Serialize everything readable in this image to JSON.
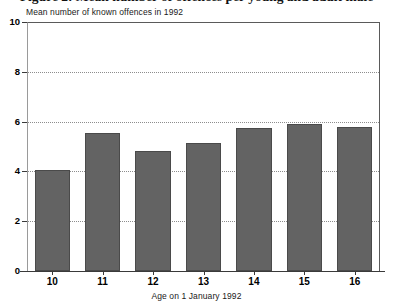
{
  "figure": {
    "title_partial": "Figure 2: Mean number of offences per young and adult male"
  },
  "chart_data": {
    "type": "bar",
    "title": "",
    "subtitle": "Mean number of known offences in 1992",
    "xlabel": "Age on 1 January 1992",
    "ylabel": "Mean number of known offences in 1992",
    "categories": [
      "10",
      "11",
      "12",
      "13",
      "14",
      "15",
      "16"
    ],
    "values": [
      4.05,
      5.55,
      4.8,
      5.15,
      5.75,
      5.9,
      5.8
    ],
    "ylim": [
      0,
      10
    ],
    "ytick_labels": [
      "0",
      "2",
      "4",
      "6",
      "8",
      "10"
    ],
    "ytick_values": [
      0,
      2,
      4,
      6,
      8,
      10
    ],
    "gridlines_at": [
      2,
      4,
      6,
      8
    ],
    "grid": true,
    "legend": "none",
    "bar_color": "#636363",
    "axis_color": "#3a3a3a",
    "grid_color": "#8d8d8d",
    "background": "#ffffff"
  }
}
